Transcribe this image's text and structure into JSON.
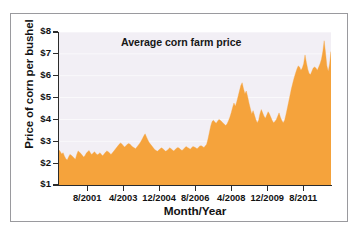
{
  "figure": {
    "border_color": "#9a9a9e",
    "background": "#ffffff"
  },
  "chart_data": {
    "type": "area",
    "title": "Average corn farm price",
    "xlabel": "Month/Year",
    "ylabel": "Price of corn per bushel",
    "series_name": "Average corn farm price",
    "fill_color": "#f5a33c",
    "plot_background": "#f2eff5",
    "grid": true,
    "grid_orientation": "horizontal",
    "legend": "none",
    "ylim": [
      1,
      8
    ],
    "ytick_labels": [
      "$1",
      "$2",
      "$3",
      "$4",
      "$5",
      "$6",
      "$7",
      "$8"
    ],
    "ytick_values": [
      1,
      2,
      3,
      4,
      5,
      6,
      7,
      8
    ],
    "xtick_labels": [
      "8/2001",
      "4/2003",
      "12/2004",
      "8/2006",
      "4/2008",
      "12/2009",
      "8/2011"
    ],
    "x_axis_units": "month/year (monthly observations)",
    "x_start": "1/2000",
    "x_end": "9/2012",
    "y_axis_units": "US dollars per bushel",
    "values": [
      2.6,
      2.52,
      2.42,
      2.48,
      2.32,
      2.2,
      2.14,
      2.28,
      2.4,
      2.36,
      2.3,
      2.24,
      2.18,
      2.4,
      2.56,
      2.5,
      2.44,
      2.36,
      2.28,
      2.34,
      2.46,
      2.52,
      2.58,
      2.46,
      2.4,
      2.46,
      2.52,
      2.44,
      2.38,
      2.42,
      2.48,
      2.4,
      2.34,
      2.42,
      2.5,
      2.56,
      2.52,
      2.46,
      2.4,
      2.46,
      2.54,
      2.62,
      2.7,
      2.78,
      2.86,
      2.92,
      2.88,
      2.8,
      2.74,
      2.8,
      2.86,
      2.9,
      2.86,
      2.8,
      2.74,
      2.7,
      2.66,
      2.74,
      2.82,
      2.9,
      3.0,
      3.12,
      3.24,
      3.34,
      3.2,
      3.06,
      2.94,
      2.86,
      2.78,
      2.7,
      2.62,
      2.58,
      2.54,
      2.6,
      2.66,
      2.7,
      2.66,
      2.6,
      2.54,
      2.58,
      2.64,
      2.7,
      2.66,
      2.6,
      2.56,
      2.62,
      2.68,
      2.72,
      2.68,
      2.62,
      2.58,
      2.64,
      2.7,
      2.76,
      2.72,
      2.68,
      2.64,
      2.7,
      2.76,
      2.74,
      2.7,
      2.66,
      2.72,
      2.78,
      2.8,
      2.76,
      2.72,
      2.78,
      2.86,
      3.1,
      3.4,
      3.7,
      3.9,
      3.96,
      3.88,
      3.82,
      3.92,
      4.0,
      3.96,
      3.9,
      3.84,
      3.78,
      3.72,
      3.8,
      3.94,
      4.1,
      4.3,
      4.55,
      4.75,
      4.6,
      4.8,
      5.05,
      5.3,
      5.55,
      5.68,
      5.4,
      5.18,
      5.3,
      5.05,
      4.75,
      4.5,
      4.25,
      4.4,
      4.2,
      4.0,
      3.85,
      3.95,
      4.25,
      4.45,
      4.3,
      4.15,
      4.05,
      4.2,
      4.35,
      4.25,
      4.1,
      3.95,
      3.85,
      3.9,
      4.0,
      4.15,
      4.3,
      4.1,
      3.95,
      3.85,
      3.95,
      4.2,
      4.5,
      4.8,
      5.1,
      5.4,
      5.65,
      5.9,
      6.1,
      6.3,
      6.45,
      6.4,
      6.25,
      6.35,
      6.55,
      6.95,
      6.6,
      6.3,
      6.1,
      6.05,
      6.2,
      6.35,
      6.4,
      6.35,
      6.25,
      6.4,
      6.55,
      6.75,
      7.1,
      7.6,
      7.05,
      6.45,
      6.2,
      6.55,
      7.1
    ]
  }
}
